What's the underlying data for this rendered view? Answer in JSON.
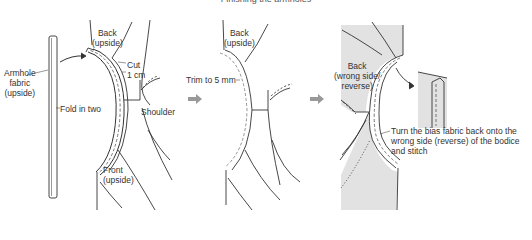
{
  "title": "Finishing the armholes",
  "colors": {
    "line": "#333333",
    "stitch": "#555555",
    "shade": "#e0e0e0",
    "arrow": "#999999"
  },
  "panels": [
    {
      "id": "step1",
      "labels": {
        "back": "Back",
        "back_sub": "(upside)",
        "cut": "Cut",
        "cut_size": "1 cm",
        "armhole_1": "Armhole",
        "armhole_2": "fabric",
        "armhole_3": "(upside)",
        "fold": "Fold in two",
        "shoulder": "Shoulder",
        "front": "Front",
        "front_sub": "(upside)"
      }
    },
    {
      "id": "step2",
      "labels": {
        "back": "Back",
        "back_sub": "(upside)",
        "trim": "Trim to 5 mm"
      }
    },
    {
      "id": "step3",
      "labels": {
        "back": "Back",
        "back_sub1": "(wrong side/",
        "back_sub2": "reverse)",
        "instruction_1": "Turn the bias fabric back onto the",
        "instruction_2": "wrong side (reverse) of the bodice",
        "instruction_3": "and stitch"
      }
    }
  ],
  "step_arrows": [
    "arrow-step1-to-step2",
    "arrow-step2-to-step3"
  ]
}
